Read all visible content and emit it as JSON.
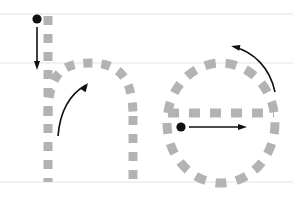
{
  "worksheet": {
    "title": "Handwriting stroke-order practice",
    "letters": [
      "n",
      "e"
    ],
    "background_color": "#ffffff",
    "canvas": {
      "width": 293,
      "height": 198
    }
  },
  "guide_lines": {
    "color": "#e4e4e4",
    "stroke_width": 1.2,
    "lines": [
      {
        "name": "ascender-line",
        "y": 14,
        "x1": 0,
        "x2": 293
      },
      {
        "name": "midline",
        "y": 63,
        "x1": 0,
        "x2": 293
      },
      {
        "name": "baseline",
        "y": 182,
        "x1": 0,
        "x2": 293
      }
    ]
  },
  "stroke_guide": {
    "color": "#b3b3b3",
    "stroke_width": 9,
    "dash_pattern": "9 9",
    "dash_pattern_wide": "11 10",
    "linecap": "butt"
  },
  "arrows": {
    "color": "#111111",
    "stroke_width": 1.6,
    "start_dot_radius": 4.6,
    "head_length": 9,
    "head_width": 6
  },
  "letter_n": {
    "name": "lowercase-n",
    "stem": {
      "x": 48,
      "y_top": 16,
      "y_bottom": 182
    },
    "arch": {
      "path": "M48,116 C48,70 66,63 90,63 C114,63 133,72 133,116"
    },
    "right_stem": {
      "x": 133,
      "y_top": 116,
      "y_bottom": 182
    },
    "start_dot": {
      "cx": 37,
      "cy": 19
    },
    "stroke_1_arrow": {
      "x1": 37,
      "y1": 27,
      "x2": 37,
      "y2": 70,
      "direction": "down"
    },
    "stroke_2_arrow": {
      "path": "M58,136 C60,112 70,94 86,85",
      "direction": "up-right",
      "head_at": [
        88,
        83
      ],
      "head_angle": -57
    }
  },
  "letter_e": {
    "name": "lowercase-e",
    "circle": {
      "cx": 221,
      "cy": 123,
      "rx": 54,
      "ry": 60
    },
    "crossbar": {
      "x1": 168,
      "y1": 113,
      "x2": 274,
      "y2": 113
    },
    "start_dot": {
      "cx": 181,
      "cy": 127
    },
    "stroke_1_arrow": {
      "x1": 189,
      "y1": 127,
      "x2": 247,
      "y2": 127,
      "direction": "right"
    },
    "stroke_2_arrow": {
      "path": "M275,92 C270,68 254,52 234,47",
      "direction": "up-left",
      "head_at": [
        231,
        46
      ],
      "head_angle": 192
    }
  }
}
